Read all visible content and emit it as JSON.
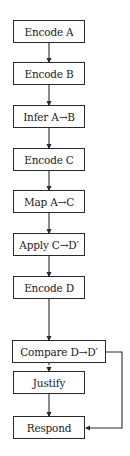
{
  "diagram": {
    "type": "flowchart",
    "nodes": [
      {
        "id": "encode_a",
        "label": "Encode A"
      },
      {
        "id": "encode_b",
        "label": "Encode B"
      },
      {
        "id": "infer_ab",
        "label": "Infer A→B"
      },
      {
        "id": "encode_c",
        "label": "Encode C"
      },
      {
        "id": "map_ac",
        "label": "Map A→C"
      },
      {
        "id": "apply_cd",
        "label": "Apply C→D′"
      },
      {
        "id": "encode_d",
        "label": "Encode D"
      },
      {
        "id": "compare_dd",
        "label": "Compare D→D′"
      },
      {
        "id": "justify",
        "label": "Justify"
      },
      {
        "id": "respond",
        "label": "Respond"
      }
    ],
    "edges": [
      {
        "from": "encode_a",
        "to": "encode_b",
        "style": "solid"
      },
      {
        "from": "encode_b",
        "to": "infer_ab",
        "style": "solid"
      },
      {
        "from": "infer_ab",
        "to": "encode_c",
        "style": "solid"
      },
      {
        "from": "encode_c",
        "to": "map_ac",
        "style": "solid"
      },
      {
        "from": "map_ac",
        "to": "apply_cd",
        "style": "solid"
      },
      {
        "from": "apply_cd",
        "to": "encode_d",
        "style": "solid"
      },
      {
        "from": "encode_d",
        "to": "compare_dd",
        "style": "solid"
      },
      {
        "from": "compare_dd",
        "to": "justify",
        "style": "dashed"
      },
      {
        "from": "justify",
        "to": "respond",
        "style": "solid"
      },
      {
        "from": "compare_dd",
        "to": "respond",
        "style": "solid",
        "route": "right-side bypass"
      }
    ],
    "colors": {
      "stroke": "#2a2a2a",
      "background": "#ffffff",
      "text": "#222222"
    }
  }
}
